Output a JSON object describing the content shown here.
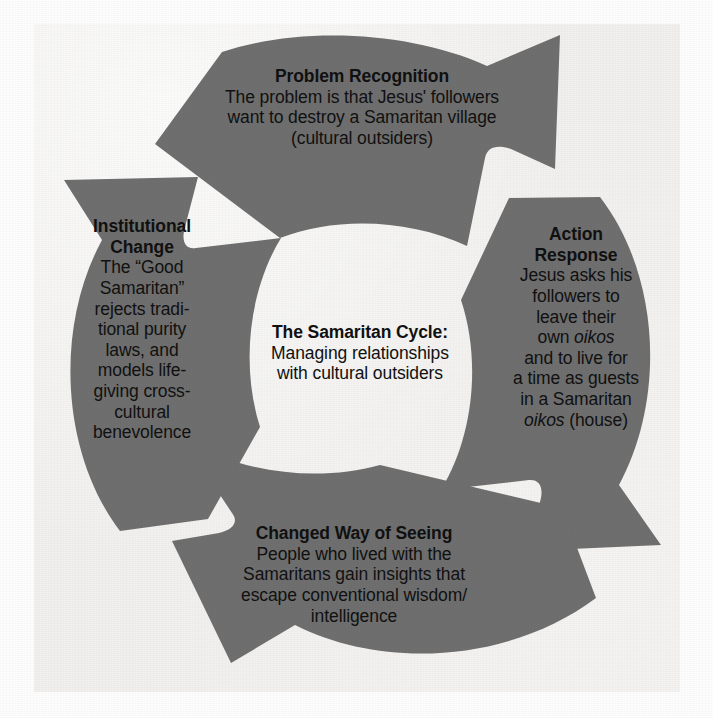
{
  "figure": {
    "kind": "cycle-diagram",
    "arrow_color": "#6f6f6f",
    "text_color": "#111111",
    "background_color": "#f1f0ee",
    "page_background": "#fdfdfd"
  },
  "center": {
    "title": "The Samaritan Cycle:",
    "line1": "Managing relationships",
    "line2": "with cultural outsiders"
  },
  "stages": {
    "problem": {
      "title": "Problem Recognition",
      "line1": "The problem is that Jesus' followers",
      "line2": "want to destroy a Samaritan village",
      "line3": "(cultural outsiders)"
    },
    "action": {
      "title_line1": "Action",
      "title_line2": "Response",
      "line1": "Jesus asks his",
      "line2": "followers to",
      "line3": "leave their",
      "line4_a": "own ",
      "line4_i": "oikos",
      "line5": "and to live for",
      "line6": "a time as guests",
      "line7": "in a Samaritan",
      "line8_i": "oikos",
      "line8_a": " (house)"
    },
    "changed": {
      "title": "Changed Way of Seeing",
      "line1": "People who lived with the",
      "line2": "Samaritans gain insights that",
      "line3": "escape conventional wisdom/",
      "line4": "intelligence"
    },
    "institutional": {
      "title_line1": "Institutional",
      "title_line2": "Change",
      "line1": "The “Good",
      "line2": "Samaritan”",
      "line3": "rejects tradi-",
      "line4": "tional purity",
      "line5": "laws, and",
      "line6": "models life-",
      "line7": "giving cross-",
      "line8": "cultural",
      "line9": "benevolence"
    }
  }
}
